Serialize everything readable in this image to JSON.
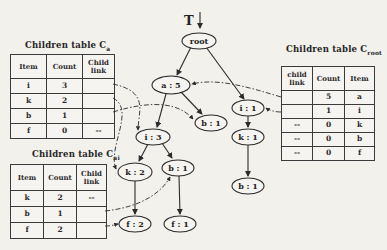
{
  "diagram": {
    "tree_label": "T",
    "nodes": {
      "root": "root",
      "a5": "a : 5",
      "i1": "i : 1",
      "b1_mid": "b : 1",
      "i3": "i : 3",
      "k1": "k : 1",
      "k2": "k : 2",
      "b1_left": "b : 1",
      "b1_right": "b : 1",
      "f2": "f : 2",
      "f1": "f : 1"
    },
    "colors": {
      "ink": "#2b2b2b",
      "background": "#f3f1ec"
    }
  },
  "tables": {
    "ca": {
      "title": "Children table C",
      "title_sub": "a",
      "headers": [
        "Item",
        "Count",
        "Child link"
      ],
      "rows": [
        {
          "item": "i",
          "count": "3",
          "child_link": ""
        },
        {
          "item": "k",
          "count": "2",
          "child_link": ""
        },
        {
          "item": "b",
          "count": "1",
          "child_link": ""
        },
        {
          "item": "f",
          "count": "0",
          "child_link": "--"
        }
      ]
    },
    "cai": {
      "title": "Children table C",
      "title_sub": "ai",
      "headers": [
        "Item",
        "Count",
        "Child link"
      ],
      "rows": [
        {
          "item": "k",
          "count": "2",
          "child_link": "--"
        },
        {
          "item": "b",
          "count": "1",
          "child_link": ""
        },
        {
          "item": "f",
          "count": "2",
          "child_link": ""
        }
      ]
    },
    "croot": {
      "title": "Children table C",
      "title_sub": "root",
      "headers": [
        "child link",
        "Count",
        "Item"
      ],
      "rows": [
        {
          "child_link": "",
          "count": "5",
          "item": "a"
        },
        {
          "child_link": "",
          "count": "1",
          "item": "i"
        },
        {
          "child_link": "--",
          "count": "0",
          "item": "k"
        },
        {
          "child_link": "--",
          "count": "0",
          "item": "b"
        },
        {
          "child_link": "--",
          "count": "0",
          "item": "f"
        }
      ]
    }
  }
}
